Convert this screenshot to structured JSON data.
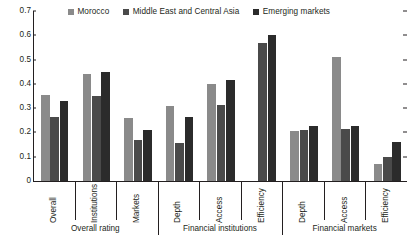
{
  "chart_data": {
    "type": "bar",
    "title": "",
    "xlabel": "",
    "ylabel": "",
    "ylim": [
      0,
      0.7
    ],
    "ytick_labels": [
      "0",
      "0.1",
      "0.2",
      "0.3",
      "0.4",
      "0.5",
      "0.6",
      "0.7"
    ],
    "ytick_values": [
      0,
      0.1,
      0.2,
      0.3,
      0.4,
      0.5,
      0.6,
      0.7
    ],
    "grid": false,
    "legend_position": "top",
    "categories": [
      "Overall",
      "Institutions",
      "Markets",
      "Depth",
      "Access",
      "Efficiency",
      "Depth",
      "Access",
      "Efficiency"
    ],
    "group_labels": [
      "Overall rating",
      "Financial institutions",
      "Financial markets"
    ],
    "group_spans": [
      3,
      3,
      3
    ],
    "series": [
      {
        "name": "Morocco",
        "color": "#8a8a8a",
        "values": [
          0.355,
          0.44,
          0.26,
          0.31,
          0.4,
          0.0,
          0.205,
          0.51,
          0.07
        ]
      },
      {
        "name": "Middle East and Central Asia",
        "color": "#4a4a4a",
        "values": [
          0.265,
          0.35,
          0.17,
          0.155,
          0.315,
          0.57,
          0.21,
          0.215,
          0.1
        ]
      },
      {
        "name": "Emerging markets",
        "color": "#2b2b2b",
        "values": [
          0.33,
          0.45,
          0.21,
          0.265,
          0.415,
          0.6,
          0.225,
          0.225,
          0.16
        ]
      }
    ]
  },
  "colors": {
    "axis": "#231f20",
    "background": "#ffffff",
    "text": "#231f20"
  }
}
